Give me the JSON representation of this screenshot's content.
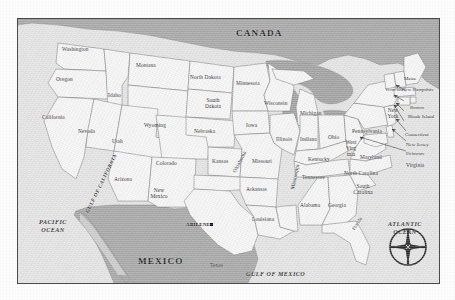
{
  "map": {
    "title_visible": false,
    "countries": [
      {
        "name": "CANADA",
        "x": 218,
        "y": 14
      },
      {
        "name": "MEXICO",
        "x": 128,
        "y": 243
      }
    ],
    "oceans": [
      {
        "name": "PACIFIC\nOCEAN",
        "x": 22,
        "y": 204
      },
      {
        "name": "ATLANTIC\nOCEAN",
        "x": 370,
        "y": 205
      },
      {
        "name": "GULF OF MEXICO",
        "x": 250,
        "y": 256
      },
      {
        "name": "GULF OF CALIFORNIA",
        "x": 72,
        "y": 205
      }
    ],
    "city": {
      "name": "ABILENE",
      "x": 186,
      "y": 208,
      "marker": "square-dot"
    },
    "states": [
      {
        "name": "Washington",
        "x": 58,
        "y": 35
      },
      {
        "name": "Oregon",
        "x": 51,
        "y": 58
      },
      {
        "name": "California",
        "x": 32,
        "y": 97
      },
      {
        "name": "Idaho",
        "x": 95,
        "y": 72
      },
      {
        "name": "Nevada",
        "x": 58,
        "y": 120
      },
      {
        "name": "Montana",
        "x": 125,
        "y": 43
      },
      {
        "name": "Wyoming",
        "x": 133,
        "y": 107
      },
      {
        "name": "Utah",
        "x": 92,
        "y": 130
      },
      {
        "name": "Arizona",
        "x": 100,
        "y": 170
      },
      {
        "name": "Colorado",
        "x": 145,
        "y": 150
      },
      {
        "name": "New\nMexico",
        "x": 134,
        "y": 183
      },
      {
        "name": "North Dakota",
        "x": 179,
        "y": 55
      },
      {
        "name": "South\nDakota",
        "x": 192,
        "y": 81
      },
      {
        "name": "Nebraska",
        "x": 190,
        "y": 119
      },
      {
        "name": "Kansas",
        "x": 196,
        "y": 148
      },
      {
        "name": "Oklahoma",
        "x": 214,
        "y": 160
      },
      {
        "name": "Texas",
        "x": 198,
        "y": 248
      },
      {
        "name": "Minnesota",
        "x": 231,
        "y": 67
      },
      {
        "name": "Iowa",
        "x": 235,
        "y": 111
      },
      {
        "name": "Missouri",
        "x": 244,
        "y": 147
      },
      {
        "name": "Arkansas",
        "x": 240,
        "y": 174
      },
      {
        "name": "Louisiana",
        "x": 247,
        "y": 203
      },
      {
        "name": "Wisconsin",
        "x": 258,
        "y": 85
      },
      {
        "name": "Illinois",
        "x": 268,
        "y": 120
      },
      {
        "name": "Mississippi",
        "x": 272,
        "y": 180
      },
      {
        "name": "Michigan",
        "x": 292,
        "y": 94
      },
      {
        "name": "Indiana",
        "x": 291,
        "y": 121
      },
      {
        "name": "Kentucky",
        "x": 300,
        "y": 143
      },
      {
        "name": "Tennessee",
        "x": 294,
        "y": 161
      },
      {
        "name": "Alabama",
        "x": 291,
        "y": 185
      },
      {
        "name": "Ohio",
        "x": 315,
        "y": 118
      },
      {
        "name": "Georgia",
        "x": 316,
        "y": 185
      },
      {
        "name": "Florida",
        "x": 337,
        "y": 216
      },
      {
        "name": "West\nVirg\ninia",
        "x": 329,
        "y": 128
      },
      {
        "name": "Maryland",
        "x": 348,
        "y": 140
      },
      {
        "name": "Virginia",
        "x": 393,
        "y": 148
      },
      {
        "name": "North Carolina",
        "x": 337,
        "y": 155
      },
      {
        "name": "South\nCarolina",
        "x": 336,
        "y": 170
      },
      {
        "name": "Pennsylvania",
        "x": 343,
        "y": 112
      },
      {
        "name": "New\nYork",
        "x": 369,
        "y": 92
      },
      {
        "name": "New Jersey",
        "x": 393,
        "y": 127
      },
      {
        "name": "Delaware",
        "x": 393,
        "y": 136
      },
      {
        "name": "Connecticut",
        "x": 392,
        "y": 118
      },
      {
        "name": "Rhode\nIsland",
        "x": 398,
        "y": 100
      },
      {
        "name": "Boston",
        "x": 398,
        "y": 91
      },
      {
        "name": "New\nHampshire",
        "x": 391,
        "y": 74
      },
      {
        "name": "Verm\nont",
        "x": 373,
        "y": 73
      },
      {
        "name": "Maine",
        "x": 392,
        "y": 63
      }
    ],
    "compass": {
      "name": "compass-rose",
      "x": 368,
      "y": 206
    },
    "colors": {
      "land": "#f7f7f7",
      "foreign_land": "#a8a8a8",
      "water": "#9d9d9d",
      "ocean_bg": "#e4e4e4",
      "border_line": "#6e6e6e",
      "frame": "#4a4a4a",
      "text": "#2b2b2b"
    }
  }
}
